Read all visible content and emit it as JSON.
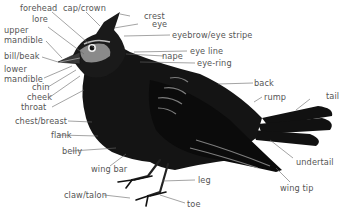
{
  "diagram": {
    "colors": {
      "label_text": "#555555",
      "leader_line": "#666666",
      "plumage": "#111111",
      "highlight": "#9a9a9a",
      "background": "#ffffff"
    },
    "labels": {
      "forehead": "forehead",
      "cap_crown": "cap/crown",
      "crest": "crest",
      "eye": "eye",
      "eyebrow": "eyebrow/eye stripe",
      "lore": "lore",
      "upper_mandible_1": "upper",
      "upper_mandible_2": "mandible",
      "eye_line": "eye line",
      "nape": "nape",
      "eye_ring": "eye-ring",
      "bill": "bill/beak",
      "lower_mandible_1": "lower",
      "lower_mandible_2": "mandible",
      "chin": "chin",
      "cheek": "cheek",
      "throat": "throat",
      "back": "back",
      "rump": "rump",
      "tail": "tail",
      "chest": "chest/breast",
      "flank": "flank",
      "belly": "belly",
      "wing_bar": "wing bar",
      "undertail": "undertail",
      "leg": "leg",
      "wing_tip": "wing tip",
      "claw": "claw/talon",
      "toe": "toe"
    }
  }
}
